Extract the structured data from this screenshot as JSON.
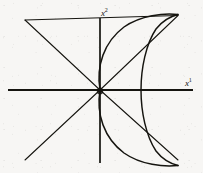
{
  "figure": {
    "background_color": "#f7f6f4",
    "ink_color": "#15140f",
    "axes": {
      "horizontal": {
        "label_text": "x",
        "label_superscript": "1",
        "name": "x1-axis",
        "y_position": 90,
        "x_start": 8,
        "x_end": 193
      },
      "vertical": {
        "label_text": "x",
        "label_superscript": "2",
        "name": "x2-axis",
        "x_position": 100,
        "y_start": 18,
        "y_end": 163
      },
      "origin": {
        "x": 100,
        "y": 90
      }
    },
    "diagonals": [
      {
        "name": "diagonal-upper-left-to-upper-right",
        "from": {
          "x": 25,
          "y": 20
        },
        "to": {
          "x": 178,
          "y": 15
        },
        "through_origin": true
      },
      {
        "name": "diagonal-lower-left-to-lower-right",
        "from": {
          "x": 25,
          "y": 160
        },
        "to": {
          "x": 178,
          "y": 160
        },
        "through_origin": true
      }
    ],
    "curve": {
      "name": "cusped-curve",
      "description": "Semicubical-parabola-like curve with a cusp at the origin, opening to the right, meeting sharp points at upper-right and lower-right",
      "cusp_at_origin": {
        "x": 100,
        "y": 90
      },
      "upper_tip": {
        "x": 178,
        "y": 15
      },
      "lower_tip": {
        "x": 178,
        "y": 160
      },
      "vertex_right": {
        "x": 141,
        "y": 90
      },
      "symmetry": "mirror about the horizontal axis"
    }
  }
}
